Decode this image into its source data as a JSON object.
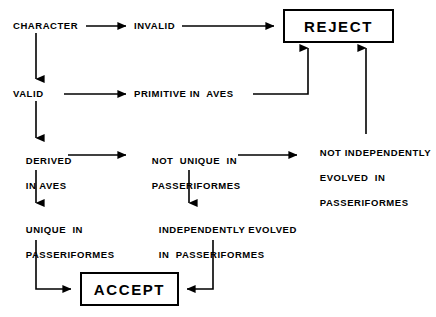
{
  "diagram": {
    "background_color": "#ffffff",
    "line_color": "#000000",
    "text_color": "#000000",
    "nodes": {
      "character": "CHARACTER",
      "invalid": "INVALID",
      "valid": "VALID",
      "primitive_in_aves": "PRIMITIVE IN  AVES",
      "derived_in_aves_line1": "DERIVED",
      "derived_in_aves_line2": "IN AVES",
      "not_unique_line1": "NOT  UNIQUE  IN",
      "not_unique_line2": "PASSERIFORMES",
      "not_independently_line1": "NOT INDEPENDENTLY",
      "not_independently_line2": "EVOLVED  IN",
      "not_independently_line3": "PASSERIFORMES",
      "unique_line1": "UNIQUE  IN",
      "unique_line2": "PASSERIFORMES",
      "independently_evolved_line1": "INDEPENDENTLY EVOLVED",
      "independently_evolved_line2": "IN  PASSERIFORMES",
      "reject": "REJECT",
      "accept": "ACCEPT"
    }
  }
}
